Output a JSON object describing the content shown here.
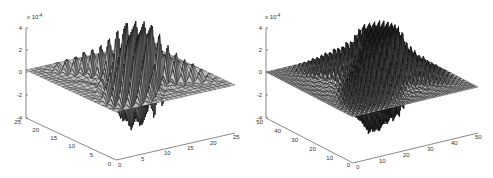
{
  "chart_data": [
    {
      "type": "surface3d",
      "title": "",
      "z_multiplier_label": "x 10^-4",
      "z_exponent": "-4",
      "xlabel": "",
      "ylabel": "",
      "zlabel": "",
      "x_ticks": [
        "0",
        "5",
        "10",
        "15",
        "20",
        "25"
      ],
      "y_ticks": [
        "0",
        "5",
        "10",
        "15",
        "20",
        "25"
      ],
      "z_ticks": [
        "4",
        "2",
        "0",
        "-2",
        "-4"
      ],
      "xlim": [
        0,
        25
      ],
      "ylim": [
        0,
        25
      ],
      "zlim": [
        -4,
        4
      ],
      "grid_size": 25,
      "description": "Oscillatory surface mesh with sharp alternating peaks along diagonal bands, amplitude up to about ±4e-4",
      "grid": false,
      "colormap": "gray"
    },
    {
      "type": "surface3d",
      "title": "",
      "z_multiplier_label": "x 10^-4",
      "z_exponent": "-4",
      "xlabel": "",
      "ylabel": "",
      "zlabel": "",
      "x_ticks": [
        "0",
        "10",
        "20",
        "30",
        "40",
        "50"
      ],
      "y_ticks": [
        "0",
        "10",
        "20",
        "30",
        "40",
        "50"
      ],
      "z_ticks": [
        "4",
        "2",
        "0",
        "-2",
        "-4"
      ],
      "xlim": [
        0,
        50
      ],
      "ylim": [
        0,
        50
      ],
      "zlim": [
        -4,
        4
      ],
      "grid_size": 50,
      "description": "Finer oscillatory surface mesh with dense alternating spikes along two diagonal bands, amplitude up to about ±4e-4",
      "grid": false,
      "colormap": "gray"
    }
  ],
  "plots": [
    {
      "exp_prefix": "x 10",
      "exp_sup": "-4",
      "z_ticks": [
        "4",
        "2",
        "0",
        "-2",
        "-4"
      ],
      "x_ticks": [
        "0",
        "5",
        "10",
        "15",
        "20",
        "25"
      ],
      "y_ticks": [
        "0",
        "5",
        "10",
        "15",
        "20",
        "25"
      ]
    },
    {
      "exp_prefix": "x 10",
      "exp_sup": "-4",
      "z_ticks": [
        "4",
        "2",
        "0",
        "-2",
        "-4"
      ],
      "x_ticks": [
        "0",
        "10",
        "20",
        "30",
        "40",
        "50"
      ],
      "y_ticks": [
        "0",
        "10",
        "20",
        "30",
        "40",
        "50"
      ]
    }
  ]
}
